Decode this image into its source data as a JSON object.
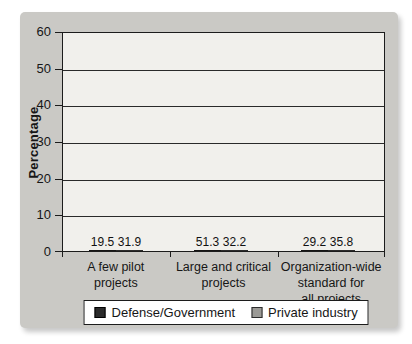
{
  "chart_data": {
    "type": "bar",
    "categories": [
      "A few pilot\nprojects",
      "Large and critical\nprojects",
      "Organization-wide\nstandard for\nall projects"
    ],
    "series": [
      {
        "name": "Defense/Government",
        "color": "#2b2b2b",
        "values": [
          19.5,
          51.3,
          29.2
        ]
      },
      {
        "name": "Private industry",
        "color": "#9b9a96",
        "values": [
          31.9,
          32.2,
          35.8
        ]
      }
    ],
    "title": "",
    "xlabel": "",
    "ylabel": "Percentage",
    "ylim": [
      0,
      60
    ],
    "yticks": [
      0,
      10,
      20,
      30,
      40,
      50,
      60
    ],
    "grid": "horizontal",
    "legend_position": "bottom",
    "plot_background": "#f1f0ec",
    "panel_background": "#cac9c5"
  }
}
